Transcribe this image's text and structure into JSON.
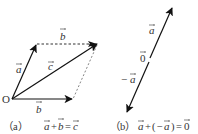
{
  "figure_a": {
    "origin_label": "O",
    "vector_a_label": "a",
    "vector_b_label": "b",
    "vector_b_top_label": "b",
    "vector_c_label": "c",
    "caption_prefix": "（a）",
    "caption_equation": {
      "lhs1": "a",
      "op": "+",
      "lhs2": "b",
      "eq": "=",
      "rhs": "c"
    }
  },
  "figure_b": {
    "vector_a_label": "a",
    "zero_label": "0",
    "neg_a_label": "−a",
    "neg_a_sign": "−",
    "neg_a_var": "a",
    "caption_prefix": "（b）",
    "caption_equation": {
      "lhs1": "a",
      "op": "+",
      "paren_open": "(",
      "neg": "−",
      "lhs2": "a",
      "paren_close": ")",
      "eq": "=",
      "rhs": "0"
    }
  },
  "colors": {
    "stroke": "#222222",
    "dashed": "#333333",
    "text": "#333333"
  }
}
